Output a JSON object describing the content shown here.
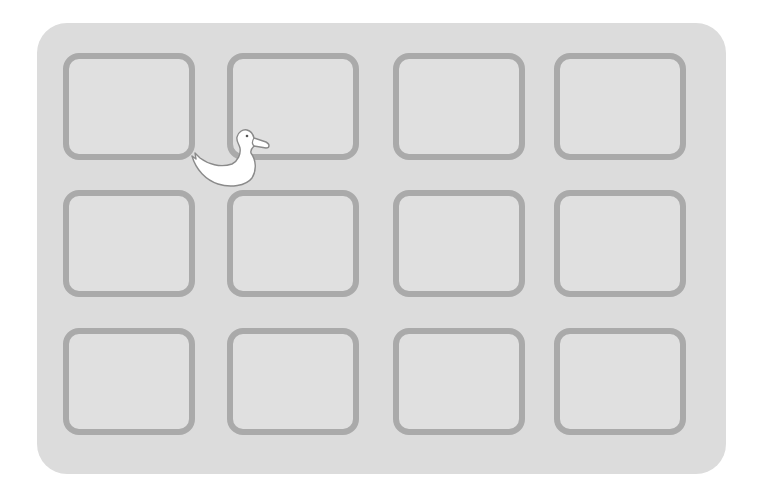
{
  "board": {
    "colors": {
      "background": "#ffffff",
      "board_fill": "#dcdcdc",
      "tile_fill": "#e0e0e0",
      "tile_border": "#aaaaaa",
      "duck_fill": "#ffffff",
      "duck_outline": "#8a8a8a"
    },
    "rows": 3,
    "columns": 4,
    "tiles": [
      {
        "row": 1,
        "col": 1,
        "state": "empty"
      },
      {
        "row": 1,
        "col": 2,
        "state": "empty"
      },
      {
        "row": 1,
        "col": 3,
        "state": "empty"
      },
      {
        "row": 1,
        "col": 4,
        "state": "empty"
      },
      {
        "row": 2,
        "col": 1,
        "state": "empty"
      },
      {
        "row": 2,
        "col": 2,
        "state": "empty"
      },
      {
        "row": 2,
        "col": 3,
        "state": "empty"
      },
      {
        "row": 2,
        "col": 4,
        "state": "empty"
      },
      {
        "row": 3,
        "col": 1,
        "state": "empty"
      },
      {
        "row": 3,
        "col": 2,
        "state": "empty"
      },
      {
        "row": 3,
        "col": 3,
        "state": "empty"
      },
      {
        "row": 3,
        "col": 4,
        "state": "empty"
      }
    ]
  },
  "pieces": [
    {
      "type": "duck-icon",
      "facing": "right",
      "position": "between row 1 col 1 and col 2"
    }
  ]
}
